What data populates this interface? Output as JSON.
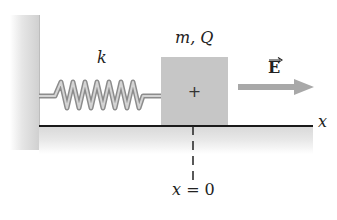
{
  "diagram": {
    "labels": {
      "spring_constant": "k",
      "block": "m, Q",
      "block_charge_sign": "+",
      "field": "E",
      "axis": "x",
      "origin": "x = 0",
      "origin_var": "x",
      "origin_eq": "= 0"
    },
    "elements": [
      {
        "id": "wall",
        "type": "fixed wall",
        "position": "left"
      },
      {
        "id": "spring",
        "type": "spring",
        "label": "k",
        "connects": [
          "wall",
          "block"
        ]
      },
      {
        "id": "block",
        "type": "mass",
        "label": "m, Q",
        "symbol": "+"
      },
      {
        "id": "field-arrow",
        "type": "vector arrow",
        "label": "E",
        "direction": "+x"
      },
      {
        "id": "floor",
        "type": "horizontal surface / x-axis",
        "label": "x"
      },
      {
        "id": "origin-marker",
        "type": "dashed line",
        "label": "x = 0"
      }
    ],
    "colors": {
      "block": "#c6c6c6",
      "arrow": "#a8a8a8",
      "spring": "#9a9a9a",
      "floor_line": "#1a1a1a",
      "wall": "#cfcfcf"
    }
  }
}
